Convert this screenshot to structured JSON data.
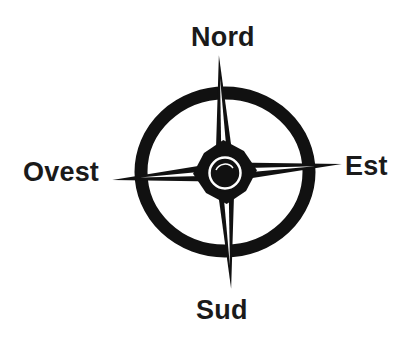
{
  "diagram": {
    "type": "compass-rose",
    "language": "Italian",
    "directions": {
      "north": "Nord",
      "south": "Sud",
      "east": "Est",
      "west": "Ovest"
    },
    "colors": {
      "ink": "#111111",
      "background": "#ffffff",
      "highlight": "#ffffff"
    }
  }
}
